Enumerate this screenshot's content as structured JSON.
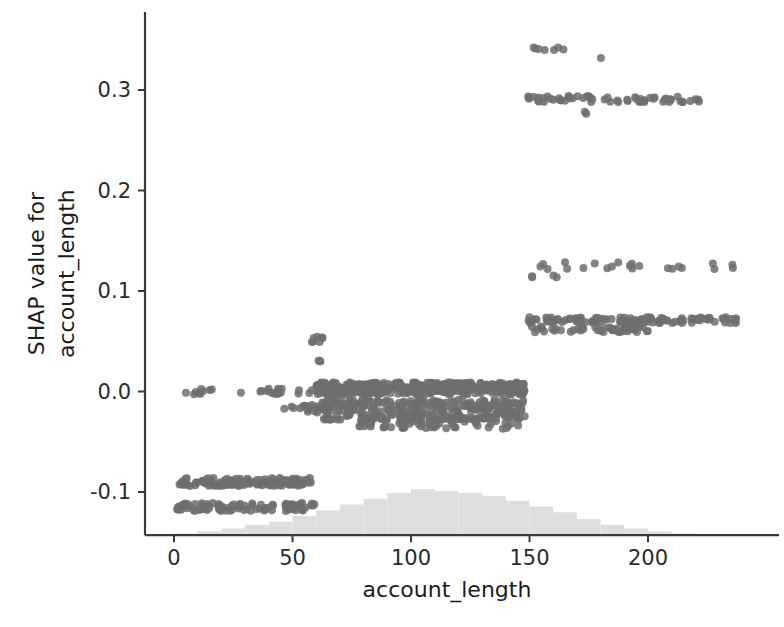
{
  "chart_data": {
    "type": "scatter",
    "title": "",
    "xlabel": "account_length",
    "ylabel": "SHAP value for account_length",
    "ylabel_line1": "SHAP value for",
    "ylabel_line2": "account_length",
    "xticks": [
      0,
      50,
      100,
      150,
      200
    ],
    "xtick_labels": [
      "0",
      "50",
      "100",
      "150",
      "200"
    ],
    "yticks": [
      -0.1,
      0.0,
      0.1,
      0.2,
      0.3
    ],
    "ytick_labels": [
      "-0.1",
      "0.0",
      "0.1",
      "0.2",
      "0.3"
    ],
    "xlim": [
      -9,
      248
    ],
    "ylim": [
      -0.145,
      0.362
    ],
    "grid": false,
    "legend": null,
    "marker_color": "#6e6e6e",
    "marker_opacity": 0.85,
    "marker_radius": 4.0,
    "histogram_color": "#dedede",
    "axis_color": "#3a3a3a",
    "text_color": "#2b2b2b",
    "background": "#ffffff",
    "clusters": [
      {
        "name": "low-band-upper",
        "y": -0.09,
        "y_jitter": 0.004,
        "x_start": 1,
        "x_end": 60,
        "count": 120
      },
      {
        "name": "low-band-lower",
        "y": -0.115,
        "y_jitter": 0.004,
        "x_start": 1,
        "x_end": 60,
        "count": 95
      },
      {
        "name": "zero-sparse-left",
        "y": 0.0,
        "y_jitter": 0.003,
        "x_start": 2,
        "x_end": 60,
        "count": 26
      },
      {
        "name": "zero-minor-left",
        "y": -0.017,
        "y_jitter": 0.004,
        "x_start": 46,
        "x_end": 62,
        "count": 16
      },
      {
        "name": "spike-60",
        "y": 0.052,
        "y_jitter": 0.003,
        "x_start": 58,
        "x_end": 63,
        "count": 7
      },
      {
        "name": "spike-60-mid",
        "y": 0.03,
        "y_jitter": 0.002,
        "x_start": 59,
        "x_end": 62,
        "count": 3
      },
      {
        "name": "main-dense-zero",
        "y": 0.003,
        "y_jitter": 0.006,
        "x_start": 60,
        "x_end": 148,
        "count": 420
      },
      {
        "name": "main-dense-negative",
        "y": -0.018,
        "y_jitter": 0.01,
        "x_start": 62,
        "x_end": 148,
        "count": 300
      },
      {
        "name": "main-dense-tail",
        "y": -0.031,
        "y_jitter": 0.006,
        "x_start": 78,
        "x_end": 146,
        "count": 90
      },
      {
        "name": "high-band-007",
        "y": 0.071,
        "y_jitter": 0.003,
        "x_start": 148,
        "x_end": 238,
        "count": 110
      },
      {
        "name": "high-band-007-lower",
        "y": 0.062,
        "y_jitter": 0.003,
        "x_start": 148,
        "x_end": 200,
        "count": 45
      },
      {
        "name": "mid-band-0125",
        "y": 0.125,
        "y_jitter": 0.004,
        "x_start": 148,
        "x_end": 237,
        "count": 22
      },
      {
        "name": "mid-band-0115",
        "y": 0.113,
        "y_jitter": 0.003,
        "x_start": 148,
        "x_end": 164,
        "count": 4
      },
      {
        "name": "high-band-029",
        "y": 0.291,
        "y_jitter": 0.003,
        "x_start": 148,
        "x_end": 222,
        "count": 60
      },
      {
        "name": "high-point-0278",
        "y": 0.278,
        "y_jitter": 0.002,
        "x_start": 172,
        "x_end": 176,
        "count": 2
      },
      {
        "name": "top-band-034",
        "y": 0.341,
        "y_jitter": 0.002,
        "x_start": 151,
        "x_end": 170,
        "count": 7
      },
      {
        "name": "top-point-0332",
        "y": 0.331,
        "y_jitter": 0.001,
        "x_start": 180,
        "x_end": 182,
        "count": 1
      }
    ],
    "histogram": {
      "label": "marginal distribution of account_length",
      "bin_edges": [
        0,
        10,
        20,
        30,
        40,
        50,
        60,
        70,
        80,
        90,
        100,
        110,
        120,
        130,
        140,
        150,
        160,
        170,
        180,
        190,
        200,
        210,
        220,
        230,
        240
      ],
      "counts": [
        2,
        4,
        7,
        11,
        14,
        20,
        26,
        32,
        38,
        44,
        48,
        46,
        44,
        41,
        36,
        30,
        24,
        17,
        11,
        7,
        4,
        2,
        1,
        1
      ]
    }
  }
}
